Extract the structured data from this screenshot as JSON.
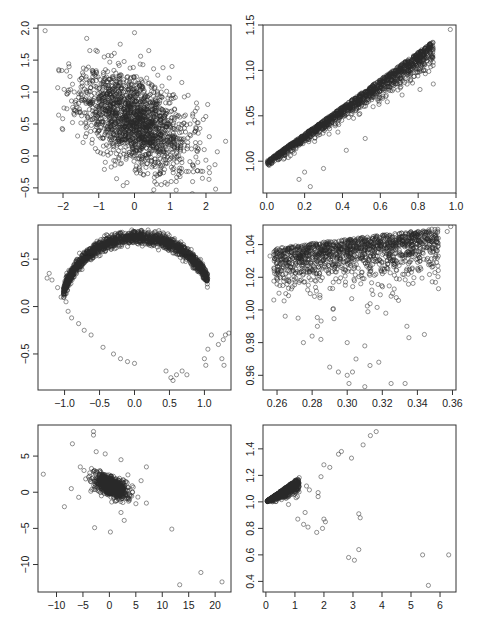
{
  "figure": {
    "layout": "3 rows x 2 columns of scatter plots",
    "marker": "open circle",
    "colors": {
      "points": "#2a2a2a",
      "axis": "#333333",
      "background": "#ffffff"
    }
  },
  "chart_data": [
    {
      "id": "r1c1",
      "type": "scatter",
      "title": "",
      "xlabel": "",
      "ylabel": "",
      "xlim": [
        -2.7,
        2.7
      ],
      "ylim": [
        -0.58,
        2.05
      ],
      "xticks": [
        -2,
        -1,
        0,
        1,
        2
      ],
      "xtick_labels": [
        "−2",
        "−1",
        "0",
        "1",
        "2"
      ],
      "yticks": [
        -0.5,
        0.0,
        0.5,
        1.0,
        1.5,
        2.0
      ],
      "ytick_labels": [
        "−0.5",
        "0.0",
        "0.5",
        "1.0",
        "1.5",
        "2.0"
      ],
      "box": [
        38,
        25,
        231,
        193
      ],
      "cloud": {
        "kind": "gauss",
        "n": 1800,
        "cx": 0.0,
        "cy": 0.55,
        "sx": 0.75,
        "sy": 0.38,
        "rho": -0.45,
        "seed": 11
      },
      "points": [
        [
          -2.5,
          1.96
        ],
        [
          -1.85,
          1.03
        ],
        [
          0.0,
          1.93
        ],
        [
          2.55,
          0.23
        ],
        [
          1.95,
          0.1
        ],
        [
          1.9,
          -0.35
        ],
        [
          0.75,
          -0.45
        ],
        [
          -1.55,
          0.68
        ],
        [
          1.5,
          0.95
        ],
        [
          1.7,
          0.7
        ],
        [
          -1.25,
          1.65
        ],
        [
          0.4,
          1.65
        ],
        [
          -0.4,
          1.75
        ],
        [
          1.05,
          1.4
        ]
      ]
    },
    {
      "id": "r1c2",
      "type": "scatter",
      "title": "",
      "xlabel": "",
      "ylabel": "",
      "xlim": [
        -0.02,
        1.0
      ],
      "ylim": [
        0.965,
        1.15
      ],
      "xticks": [
        0.0,
        0.2,
        0.4,
        0.6,
        0.8,
        1.0
      ],
      "xtick_labels": [
        "0.0",
        "0.2",
        "0.4",
        "0.6",
        "0.8",
        "1.0"
      ],
      "yticks": [
        1.0,
        1.05,
        1.1,
        1.15
      ],
      "ytick_labels": [
        "1.00",
        "1.05",
        "1.10",
        "1.15"
      ],
      "box": [
        263,
        25,
        456,
        193
      ],
      "cloud": {
        "kind": "wedge",
        "n": 1500,
        "x0": 0.0,
        "x1": 0.88,
        "yfun": "1 + 0.15*x",
        "spread": 0.045,
        "seed": 23
      },
      "points": [
        [
          0.97,
          1.145
        ],
        [
          0.87,
          1.13
        ],
        [
          0.85,
          1.122
        ],
        [
          0.82,
          1.12
        ],
        [
          0.88,
          1.085
        ],
        [
          0.81,
          1.079
        ],
        [
          0.52,
          1.025
        ],
        [
          0.42,
          1.012
        ],
        [
          0.23,
          0.972
        ],
        [
          0.17,
          0.98
        ],
        [
          0.2,
          0.988
        ],
        [
          0.3,
          0.992
        ]
      ]
    },
    {
      "id": "r2c1",
      "type": "scatter",
      "title": "",
      "xlabel": "",
      "ylabel": "",
      "xlim": [
        -1.38,
        1.38
      ],
      "ylim": [
        -0.88,
        0.86
      ],
      "xticks": [
        -1.0,
        -0.5,
        0.0,
        0.5,
        1.0
      ],
      "xtick_labels": [
        "−1.0",
        "−0.5",
        "0.0",
        "0.5",
        "1.0"
      ],
      "yticks": [
        -0.5,
        0.0,
        0.5
      ],
      "ytick_labels": [
        "−0.5",
        "0.0",
        "0.5"
      ],
      "box": [
        38,
        225,
        231,
        390
      ],
      "cloud": {
        "kind": "arc",
        "n": 1700,
        "seed": 37
      },
      "points": [
        [
          -1.25,
          0.3
        ],
        [
          -1.22,
          0.35
        ],
        [
          -1.18,
          0.28
        ],
        [
          -1.1,
          0.2
        ],
        [
          -1.05,
          0.1
        ],
        [
          -0.98,
          0.05
        ],
        [
          -0.95,
          -0.05
        ],
        [
          -0.9,
          -0.12
        ],
        [
          -0.8,
          -0.18
        ],
        [
          -0.72,
          -0.25
        ],
        [
          -0.62,
          -0.3
        ],
        [
          -0.45,
          -0.43
        ],
        [
          -0.3,
          -0.5
        ],
        [
          -0.2,
          -0.55
        ],
        [
          -0.1,
          -0.58
        ],
        [
          0.0,
          -0.6
        ],
        [
          0.45,
          -0.68
        ],
        [
          0.52,
          -0.75
        ],
        [
          0.55,
          -0.78
        ],
        [
          0.6,
          -0.72
        ],
        [
          0.68,
          -0.68
        ],
        [
          0.75,
          -0.72
        ],
        [
          1.0,
          -0.55
        ],
        [
          1.02,
          -0.62
        ],
        [
          1.05,
          -0.45
        ],
        [
          1.1,
          -0.3
        ],
        [
          1.2,
          -0.4
        ],
        [
          1.25,
          -0.55
        ],
        [
          1.28,
          -0.62
        ],
        [
          1.3,
          -0.3
        ],
        [
          1.35,
          -0.28
        ],
        [
          1.27,
          -0.35
        ]
      ]
    },
    {
      "id": "r2c2",
      "type": "scatter",
      "title": "",
      "xlabel": "",
      "ylabel": "",
      "xlim": [
        0.252,
        0.362
      ],
      "ylim": [
        0.951,
        1.052
      ],
      "xticks": [
        0.26,
        0.28,
        0.3,
        0.32,
        0.34,
        0.36
      ],
      "xtick_labels": [
        "0.26",
        "0.28",
        "0.30",
        "0.32",
        "0.34",
        "0.36"
      ],
      "yticks": [
        0.96,
        0.98,
        1.0,
        1.02,
        1.04
      ],
      "ytick_labels": [
        "0.96",
        "0.98",
        "1.00",
        "1.02",
        "1.04"
      ],
      "box": [
        263,
        225,
        456,
        390
      ],
      "cloud": {
        "kind": "topwedge",
        "n": 1400,
        "x0": 0.258,
        "x1": 0.352,
        "seed": 53
      },
      "points": [
        [
          0.256,
          1.033
        ],
        [
          0.265,
          1.01
        ],
        [
          0.272,
          0.995
        ],
        [
          0.275,
          0.98
        ],
        [
          0.28,
          0.984
        ],
        [
          0.283,
          0.99
        ],
        [
          0.285,
          0.982
        ],
        [
          0.29,
          0.965
        ],
        [
          0.295,
          0.962
        ],
        [
          0.3,
          0.96
        ],
        [
          0.301,
          0.955
        ],
        [
          0.303,
          0.962
        ],
        [
          0.305,
          0.97
        ],
        [
          0.31,
          0.953
        ],
        [
          0.31,
          0.978
        ],
        [
          0.313,
          0.966
        ],
        [
          0.318,
          0.968
        ],
        [
          0.325,
          0.955
        ],
        [
          0.333,
          0.955
        ],
        [
          0.3,
          0.98
        ],
        [
          0.322,
          0.998
        ],
        [
          0.334,
          0.99
        ],
        [
          0.344,
          0.985
        ],
        [
          0.352,
          1.013
        ],
        [
          0.357,
          1.048
        ],
        [
          0.359,
          1.051
        ],
        [
          0.348,
          1.028
        ],
        [
          0.342,
          1.025
        ]
      ]
    },
    {
      "id": "r3c1",
      "type": "scatter",
      "title": "",
      "xlabel": "",
      "ylabel": "",
      "xlim": [
        -13.5,
        23
      ],
      "ylim": [
        -13.8,
        9.3
      ],
      "xticks": [
        -10,
        -5,
        0,
        5,
        10,
        15,
        20
      ],
      "xtick_labels": [
        "−10",
        "−5",
        "0",
        "5",
        "10",
        "15",
        "20"
      ],
      "yticks": [
        -10,
        -5,
        0,
        5
      ],
      "ytick_labels": [
        "−10",
        "−5",
        "0",
        "5"
      ],
      "box": [
        38,
        425,
        231,
        592
      ],
      "cloud": {
        "kind": "gauss",
        "n": 900,
        "cx": 0.3,
        "cy": 0.8,
        "sx": 1.5,
        "sy": 0.8,
        "rho": -0.55,
        "seed": 71
      },
      "points": [
        [
          -12.5,
          2.5
        ],
        [
          -8.5,
          -2.0
        ],
        [
          -7.0,
          6.7
        ],
        [
          -7.2,
          0.5
        ],
        [
          -5.8,
          -0.7
        ],
        [
          -5.5,
          3.5
        ],
        [
          -4.8,
          3.0
        ],
        [
          -3.0,
          8.4
        ],
        [
          -3.0,
          7.9
        ],
        [
          -2.5,
          5.6
        ],
        [
          -0.8,
          5.3
        ],
        [
          2.2,
          4.5
        ],
        [
          -2.8,
          -4.9
        ],
        [
          0.2,
          -5.5
        ],
        [
          2.8,
          -3.9
        ],
        [
          2.2,
          -2.8
        ],
        [
          7.0,
          3.5
        ],
        [
          7.0,
          -1.5
        ],
        [
          6.0,
          1.6
        ],
        [
          11.8,
          -5.1
        ],
        [
          13.3,
          -12.8
        ],
        [
          17.3,
          -11.1
        ],
        [
          21.3,
          -12.4
        ],
        [
          4.5,
          0.7
        ],
        [
          3.5,
          2.4
        ]
      ]
    },
    {
      "id": "r3c2",
      "type": "scatter",
      "title": "",
      "xlabel": "",
      "ylabel": "",
      "xlim": [
        -0.1,
        6.55
      ],
      "ylim": [
        0.32,
        1.58
      ],
      "xticks": [
        0,
        1,
        2,
        3,
        4,
        5,
        6
      ],
      "xtick_labels": [
        "0",
        "1",
        "2",
        "3",
        "4",
        "5",
        "6"
      ],
      "yticks": [
        0.4,
        0.6,
        0.8,
        1.0,
        1.2,
        1.4
      ],
      "ytick_labels": [
        "0.4",
        "0.6",
        "0.8",
        "1.0",
        "1.2",
        "1.4"
      ],
      "box": [
        263,
        425,
        456,
        592
      ],
      "cloud": {
        "kind": "smallwedge",
        "n": 700,
        "seed": 89
      },
      "points": [
        [
          3.8,
          1.53
        ],
        [
          3.6,
          1.5
        ],
        [
          3.35,
          1.43
        ],
        [
          2.95,
          1.33
        ],
        [
          2.6,
          1.38
        ],
        [
          2.5,
          1.36
        ],
        [
          2.2,
          1.26
        ],
        [
          2.0,
          1.28
        ],
        [
          1.9,
          1.19
        ],
        [
          1.8,
          1.07
        ],
        [
          1.8,
          1.04
        ],
        [
          1.5,
          1.09
        ],
        [
          1.4,
          1.12
        ],
        [
          1.35,
          0.92
        ],
        [
          1.3,
          0.83
        ],
        [
          1.45,
          0.81
        ],
        [
          1.75,
          0.77
        ],
        [
          1.95,
          0.8
        ],
        [
          2.0,
          0.87
        ],
        [
          2.05,
          0.85
        ],
        [
          1.1,
          0.87
        ],
        [
          3.2,
          0.91
        ],
        [
          3.25,
          0.88
        ],
        [
          3.2,
          0.64
        ],
        [
          2.85,
          0.58
        ],
        [
          3.05,
          0.56
        ],
        [
          5.4,
          0.6
        ],
        [
          6.3,
          0.6
        ],
        [
          5.6,
          0.37
        ]
      ]
    }
  ]
}
